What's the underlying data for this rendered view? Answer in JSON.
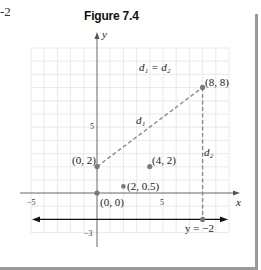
{
  "page_fragment": "-2",
  "figure": {
    "title": "Figure 7.4",
    "x_axis_label": "x",
    "y_axis_label": "y",
    "tick_labels": {
      "x_neg": "−5",
      "x_pos": "5",
      "y_pos": "5",
      "y_neg": "−3"
    },
    "equation_label": "d₁ = d₂",
    "segment_labels": {
      "d1": "d₁",
      "d2": "d₂"
    },
    "line_label": "y = −2",
    "points": [
      {
        "label": "(0, 0)",
        "x": 0,
        "y": 0
      },
      {
        "label": "(0, 2)",
        "x": 0,
        "y": 2
      },
      {
        "label": "(8, 8)",
        "x": 8,
        "y": 8
      },
      {
        "label": "(4, 2)",
        "x": 4,
        "y": 2
      },
      {
        "label": "(2, 0.5)",
        "x": 2,
        "y": 0.5
      }
    ],
    "colors": {
      "grid": "#e6e6e6",
      "axis": "#555555",
      "point": "#7a7a7a",
      "dashed": "#8a8a8a",
      "line": "#111111",
      "border": "#9a9a9a"
    }
  }
}
